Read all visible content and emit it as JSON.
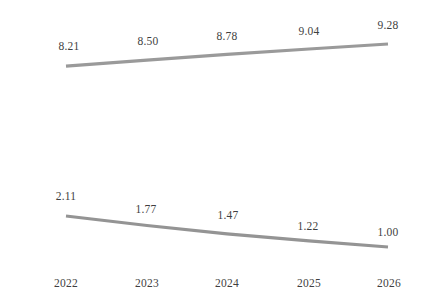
{
  "chart_data": {
    "type": "line",
    "title": "",
    "subtitle": "",
    "xlabel": "",
    "ylabel": "",
    "grid": false,
    "legend": "none",
    "axis_visible": false,
    "categories": [
      "2022",
      "2023",
      "2024",
      "2025",
      "2026"
    ],
    "series": [
      {
        "name": "series-upper",
        "color": "#9a9a9a",
        "values": [
          8.21,
          8.5,
          8.78,
          9.04,
          9.28
        ],
        "labels": [
          "8.21",
          "8.50",
          "8.78",
          "9.04",
          "9.28"
        ]
      },
      {
        "name": "series-lower",
        "color": "#949494",
        "values": [
          2.11,
          1.77,
          1.47,
          1.22,
          1.0
        ],
        "labels": [
          "2.11",
          "1.77",
          "1.47",
          "1.22",
          "1.00"
        ]
      }
    ],
    "ylim": [
      0,
      10
    ],
    "xlim": [
      "2022",
      "2026"
    ]
  },
  "colors": {
    "background": "#ffffff",
    "line_upper": "#9a9a9a",
    "line_lower": "#949494",
    "text": "#3f3f3f"
  },
  "axis": {
    "x_ticks": [
      {
        "label": "2022"
      },
      {
        "label": "2023"
      },
      {
        "label": "2024"
      },
      {
        "label": "2025"
      },
      {
        "label": "2026"
      }
    ]
  }
}
